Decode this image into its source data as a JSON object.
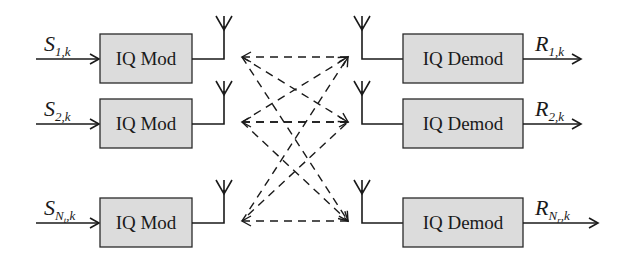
{
  "diagram": {
    "transmitters": [
      {
        "block_label": "IQ Mod",
        "input_symbol": "S",
        "input_subscript": "1,k"
      },
      {
        "block_label": "IQ Mod",
        "input_symbol": "S",
        "input_subscript": "2,k"
      },
      {
        "block_label": "IQ Mod",
        "input_symbol": "S",
        "input_subscript": "N",
        "input_subscript_sub": "t",
        "input_subscript_tail": ",k"
      }
    ],
    "receivers": [
      {
        "block_label": "IQ Demod",
        "output_symbol": "R",
        "output_subscript": "1,k"
      },
      {
        "block_label": "IQ Demod",
        "output_symbol": "R",
        "output_subscript": "2,k"
      },
      {
        "block_label": "IQ Demod",
        "output_symbol": "R",
        "output_subscript": "N",
        "output_subscript_sub": "r",
        "output_subscript_tail": ",k"
      }
    ],
    "channel": {
      "style": "dashed",
      "links": "all transmit antennas to all receive antennas"
    },
    "colors": {
      "box_fill": "#dcdcdc",
      "stroke": "#1a1a1a",
      "background": "#ffffff"
    }
  }
}
